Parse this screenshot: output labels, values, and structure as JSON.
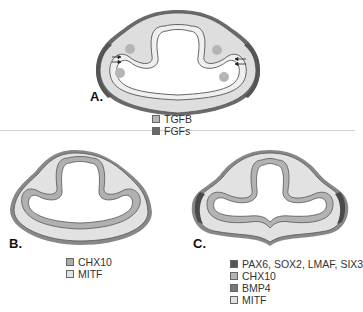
{
  "panels": [
    {
      "id": "A",
      "label": "A.",
      "legend": [
        {
          "name": "TGFB",
          "color": "#b5b5b5"
        },
        {
          "name": "FGFs",
          "color": "#6a6a6a"
        }
      ]
    },
    {
      "id": "B",
      "label": "B.",
      "legend": [
        {
          "name": "CHX10",
          "color": "#ababab"
        },
        {
          "name": "MITF",
          "color": "#e2e2e2"
        }
      ]
    },
    {
      "id": "C",
      "label": "C.",
      "legend": [
        {
          "name": "PAX6, SOX2, LMAF, SIX3",
          "color": "#555555"
        },
        {
          "name": "CHX10",
          "color": "#b3b3b3"
        },
        {
          "name": "BMP4",
          "color": "#777777"
        },
        {
          "name": "MITF",
          "color": "#e2e2e2"
        }
      ]
    }
  ]
}
